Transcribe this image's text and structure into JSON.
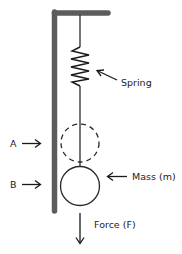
{
  "diagram": {
    "labels": {
      "spring": "Spring",
      "position_a": "A",
      "position_b": "B",
      "mass": "Mass (m)",
      "force": "Force (F)"
    },
    "colors": {
      "wall": "#5c5c5c",
      "line": "#2a2a2a",
      "text": "#222222",
      "background": "#ffffff"
    },
    "elements": {
      "support": "L-shaped wall/ceiling bracket",
      "spring": "zigzag spring hanging from ceiling",
      "mass_initial": "dashed circle at position A",
      "mass_final": "solid circle at position B",
      "force_arrow": "downward arrow below mass"
    }
  }
}
